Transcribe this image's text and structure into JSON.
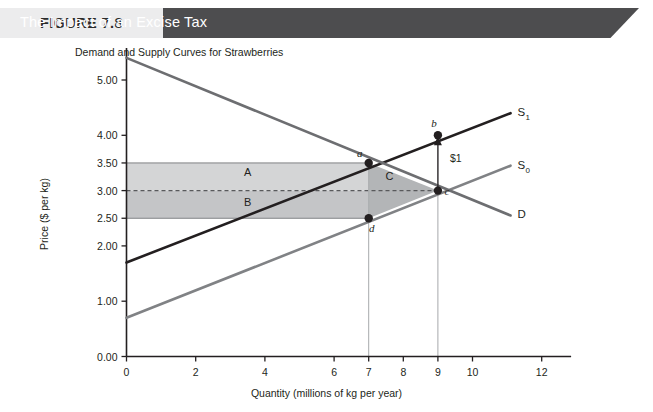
{
  "header": {
    "figure_number": "FIGURE 7.8",
    "figure_title": "The Impact of an Excise Tax",
    "number_bg": "#ececed",
    "title_bg": "#4d4d4f"
  },
  "chart_data": {
    "type": "line",
    "title": "The Impact of an Excise Tax",
    "subtitle": "Demand and Supply Curves for Strawberries",
    "xlabel": "Quantity (millions of kg per year)",
    "ylabel": "Price ($ per kg)",
    "xlim": [
      0,
      12.8
    ],
    "ylim": [
      0,
      5.6
    ],
    "grid": false,
    "legend": "inline-right",
    "xticks": [
      0,
      2,
      4,
      6,
      7,
      8,
      9,
      10,
      12
    ],
    "xtick_labels": [
      "0",
      "2",
      "4",
      "6",
      "7",
      "8",
      "9",
      "10",
      "12"
    ],
    "yticks": [
      0.0,
      1.0,
      2.0,
      2.5,
      3.0,
      3.5,
      4.0,
      5.0
    ],
    "ytick_labels": [
      "0.00",
      "1.00",
      "2.00",
      "2.50",
      "3.00",
      "3.50",
      "4.00",
      "5.00"
    ],
    "series": [
      {
        "name": "S1",
        "label": "S",
        "sublabel": "1",
        "color": "#231f20",
        "kind": "supply-with-tax",
        "points": [
          [
            0,
            1.7
          ],
          [
            11.1,
            4.4
          ]
        ]
      },
      {
        "name": "S0",
        "label": "S",
        "sublabel": "0",
        "color": "#808285",
        "kind": "supply",
        "points": [
          [
            0,
            0.7
          ],
          [
            11.1,
            3.45
          ]
        ]
      },
      {
        "name": "D",
        "label": "D",
        "sublabel": "",
        "color": "#6d6e71",
        "kind": "demand",
        "points": [
          [
            0,
            5.4
          ],
          [
            11.1,
            2.55
          ]
        ]
      }
    ],
    "points": [
      {
        "id": "a",
        "label": "a",
        "x": 7,
        "y": 3.5,
        "label_dx": -9,
        "label_dy": -6
      },
      {
        "id": "b",
        "label": "b",
        "x": 9,
        "y": 4.0,
        "label_dx": -4,
        "label_dy": -8
      },
      {
        "id": "c",
        "label": "c",
        "x": 9,
        "y": 3.0,
        "label_dx": 9,
        "label_dy": 4
      },
      {
        "id": "d",
        "label": "d",
        "x": 7,
        "y": 2.5,
        "label_dx": 3,
        "label_dy": 14
      }
    ],
    "regions": [
      {
        "id": "A",
        "label": "A",
        "shape": "rect",
        "x0": 0,
        "x1": 7,
        "y0": 3.0,
        "y1": 3.5,
        "fill": "#d4d5d6",
        "label_x": 3.5,
        "label_y": 3.27
      },
      {
        "id": "B",
        "label": "B",
        "shape": "rect",
        "x0": 0,
        "x1": 7,
        "y0": 2.5,
        "y1": 3.0,
        "fill": "#c4c5c7",
        "label_x": 3.5,
        "label_y": 2.73
      },
      {
        "id": "C",
        "label": "C",
        "shape": "triangle",
        "vertices": [
          [
            7,
            3.5
          ],
          [
            9,
            3.0
          ],
          [
            7,
            2.5
          ]
        ],
        "fill": "#b3b5b7",
        "label_x": 7.6,
        "label_y": 3.2
      }
    ],
    "annotations": [
      {
        "id": "tax-arrow",
        "text": "$1",
        "x": 9,
        "y_from": 3.0,
        "y_to": 4.0,
        "text_x": 9.35,
        "text_y": 3.52
      }
    ],
    "reference_lines": [
      {
        "id": "price-line-350",
        "y": 3.5,
        "x0": 0,
        "x1": 7,
        "style": "solid",
        "color": "#808285"
      },
      {
        "id": "price-line-300",
        "y": 3.0,
        "x0": 0,
        "x1": 9,
        "style": "dashed",
        "color": "#58595b"
      },
      {
        "id": "price-line-250",
        "y": 2.5,
        "x0": 0,
        "x1": 7,
        "style": "solid",
        "color": "#808285"
      },
      {
        "id": "quantity-line-7",
        "x": 7,
        "y0": 0,
        "y1": 3.5,
        "style": "solid",
        "color": "#a7a9ac"
      },
      {
        "id": "quantity-line-9",
        "x": 9,
        "y0": 0,
        "y1": 4.0,
        "style": "solid",
        "color": "#a7a9ac"
      }
    ]
  }
}
